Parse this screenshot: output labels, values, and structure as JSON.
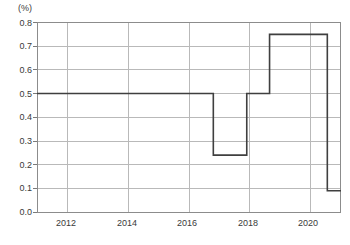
{
  "chart_data": {
    "type": "line",
    "line_style": "step-post",
    "title": "",
    "subtitle": "",
    "xlabel": "",
    "ylabel": "(%)",
    "unit_label": "(%)",
    "grid": true,
    "legend": null,
    "xlim": [
      2011.0,
      2021.0
    ],
    "ylim": [
      0.0,
      0.8
    ],
    "y_ticks": [
      "0.0",
      "0.1",
      "0.2",
      "0.3",
      "0.4",
      "0.5",
      "0.6",
      "0.7",
      "0.8"
    ],
    "y_tick_values": [
      0.0,
      0.1,
      0.2,
      0.3,
      0.4,
      0.5,
      0.6,
      0.7,
      0.8
    ],
    "x_ticks": [
      "2012",
      "2014",
      "2016",
      "2018",
      "2020"
    ],
    "x_tick_values": [
      2012,
      2014,
      2016,
      2018,
      2020
    ],
    "series": [
      {
        "name": "policy rate",
        "color": "#3f3f3f",
        "x": [
          2011.0,
          2016.8,
          2016.8,
          2017.9,
          2017.9,
          2018.65,
          2018.65,
          2020.55,
          2020.55,
          2021.0
        ],
        "y": [
          0.5,
          0.5,
          0.24,
          0.24,
          0.5,
          0.5,
          0.75,
          0.75,
          0.09,
          0.09
        ]
      }
    ],
    "steps": [
      {
        "from_x": 2011.0,
        "to_x": 2016.8,
        "value": 0.5
      },
      {
        "from_x": 2016.8,
        "to_x": 2017.9,
        "value": 0.24
      },
      {
        "from_x": 2017.9,
        "to_x": 2018.65,
        "value": 0.5
      },
      {
        "from_x": 2018.65,
        "to_x": 2020.55,
        "value": 0.75
      },
      {
        "from_x": 2020.55,
        "to_x": 2021.0,
        "value": 0.09
      }
    ],
    "annotations": []
  },
  "axes": {
    "unit": "(%)",
    "y_labels": [
      "0.8",
      "0.7",
      "0.6",
      "0.5",
      "0.4",
      "0.3",
      "0.2",
      "0.1",
      "0.0"
    ],
    "x_labels": [
      "2012",
      "2014",
      "2016",
      "2018",
      "2020"
    ]
  },
  "colors": {
    "line": "#3f3f3f",
    "grid": "#b9b9b9",
    "frame": "#8c8c8c",
    "text": "#3a3a3a",
    "background": "#ffffff"
  }
}
